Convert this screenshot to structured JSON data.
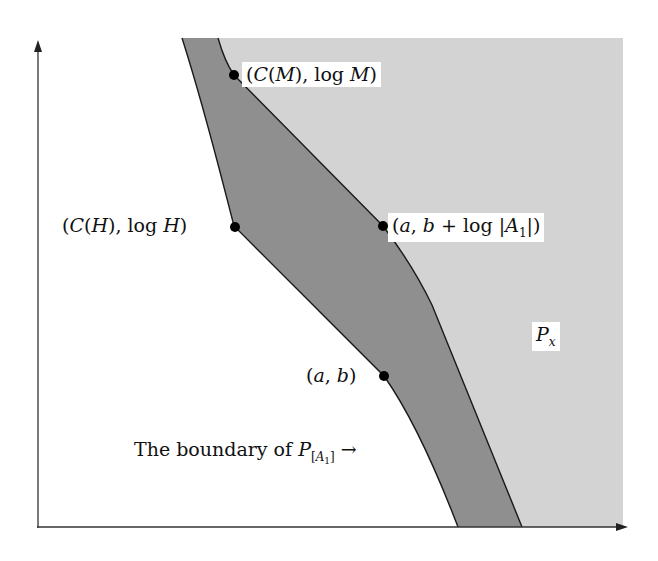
{
  "figure": {
    "type": "diagram",
    "colors": {
      "background": "#ffffff",
      "region_Px": "#d3d3d3",
      "band_dark": "#8f8f8f",
      "lines": "#1a1a1a",
      "points": "#000000"
    },
    "axes": {
      "x_axis": {
        "arrow": "right"
      },
      "y_axis": {
        "arrow": "up"
      }
    },
    "points": [
      {
        "id": "CM",
        "label": "(C(M), log M)"
      },
      {
        "id": "CH",
        "label": "(C(H), log H)"
      },
      {
        "id": "ab_logA1",
        "label": "(a, b + log |A1|)"
      },
      {
        "id": "ab",
        "label": "(a, b)"
      }
    ],
    "labels": {
      "CM_open": "(",
      "CM_C": "C",
      "CM_M": "M",
      "CM_mid": "), log ",
      "CM_M2": "M",
      "CM_close": ")",
      "CH_open": "(",
      "CH_C": "C",
      "CH_H": "H",
      "CH_mid": "), log ",
      "CH_H2": "H",
      "CH_close": ")",
      "ab1_open": "(",
      "ab1_a": "a",
      "ab1_comma": ", ",
      "ab1_b": "b",
      "ab1_mid": " + log |",
      "ab1_A": "A",
      "ab1_sub": "1",
      "ab1_close": "|)",
      "ab_open": "(",
      "ab_a": "a",
      "ab_comma": ", ",
      "ab_b": "b",
      "ab_close": ")",
      "Px_P": "P",
      "Px_sub": "x",
      "boundary_text": "The boundary of ",
      "boundary_P": "P",
      "boundary_sub_open": "[",
      "boundary_sub_A": "A",
      "boundary_sub_1": "1",
      "boundary_sub_close": "]",
      "boundary_arrow": "→"
    }
  }
}
